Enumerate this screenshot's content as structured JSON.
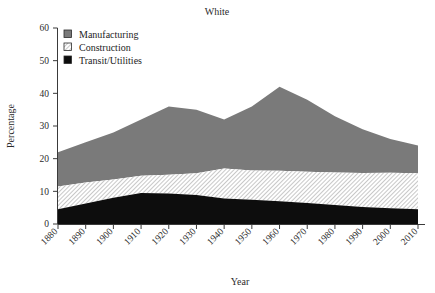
{
  "chart_data": {
    "type": "area",
    "title": "White",
    "xlabel": "Year",
    "ylabel": "Percentage",
    "stacked": true,
    "grid": false,
    "legend_position": "top-left",
    "xlim": [
      1880,
      2010
    ],
    "ylim": [
      0,
      60
    ],
    "ytick_labels": [
      "0",
      "10",
      "20",
      "30",
      "40",
      "50",
      "60"
    ],
    "yticks": [
      0,
      10,
      20,
      30,
      40,
      50,
      60
    ],
    "categories": [
      1880,
      1890,
      1900,
      1910,
      1920,
      1930,
      1940,
      1950,
      1960,
      1970,
      1980,
      1990,
      2000,
      2010
    ],
    "xtick_labels": [
      "1880",
      "1890",
      "1900",
      "1910",
      "1920",
      "1930",
      "1940",
      "1950",
      "1960",
      "1970",
      "1980",
      "1990",
      "2000",
      "2010"
    ],
    "series": [
      {
        "name": "Transit/Utilities",
        "fill": "#0d0d0d",
        "pattern": "solid-black",
        "values": [
          4.5,
          6.3,
          8.0,
          9.5,
          9.3,
          8.9,
          7.8,
          7.4,
          7.0,
          6.4,
          5.8,
          5.2,
          4.8,
          4.5
        ]
      },
      {
        "name": "Construction",
        "fill": "#f2f2f2",
        "pattern": "hatch-diagonal",
        "values": [
          7.0,
          6.4,
          5.6,
          5.3,
          5.8,
          6.6,
          9.2,
          9.0,
          9.3,
          9.6,
          10.0,
          10.4,
          10.9,
          11.0
        ]
      },
      {
        "name": "Manufacturing",
        "fill": "#7a7a7a",
        "pattern": "solid-gray",
        "values": [
          10.5,
          12.3,
          14.4,
          17.2,
          20.9,
          19.5,
          15.0,
          19.6,
          25.7,
          22.0,
          17.2,
          13.4,
          10.3,
          8.5
        ]
      }
    ],
    "cumulative_tops": {
      "transit_utilities": [
        4.5,
        6.3,
        8.0,
        9.5,
        9.3,
        8.9,
        7.8,
        7.4,
        7.0,
        6.4,
        5.8,
        5.2,
        4.8,
        4.5
      ],
      "construction": [
        11.5,
        12.7,
        13.6,
        14.8,
        15.1,
        15.5,
        17.0,
        16.4,
        16.3,
        16.0,
        15.8,
        15.6,
        15.7,
        15.5
      ],
      "manufacturing": [
        22.0,
        25.0,
        28.0,
        32.0,
        36.0,
        35.0,
        32.0,
        36.0,
        42.0,
        38.0,
        33.0,
        29.0,
        26.0,
        24.0
      ]
    }
  },
  "legend": {
    "items": [
      {
        "label": "Manufacturing"
      },
      {
        "label": "Construction"
      },
      {
        "label": "Transit/Utilities"
      }
    ]
  }
}
